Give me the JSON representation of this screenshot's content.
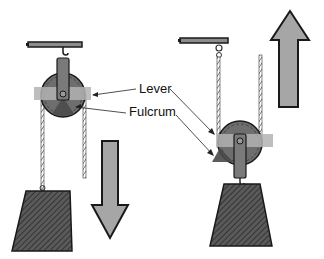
{
  "diagram": {
    "labels": {
      "lever": "Lever",
      "fulcrum": "Fulcrum"
    },
    "left_system": {
      "description": "Fixed pulley hanging from beam; load moves down",
      "arrow_direction": "down"
    },
    "right_system": {
      "description": "Movable pulley supported by rope; load moves up",
      "arrow_direction": "up"
    },
    "colors": {
      "outline": "#1a1a1a",
      "pulley_fill": "#6e6e6e",
      "lever_band": "#b3b3b3",
      "fulcrum_fill": "#4a4a4a",
      "arrow_fill": "#a6a6a6",
      "weight_fill": "#555555",
      "beam_fill": "#8c8c8c",
      "rope": "#ffffff"
    }
  }
}
